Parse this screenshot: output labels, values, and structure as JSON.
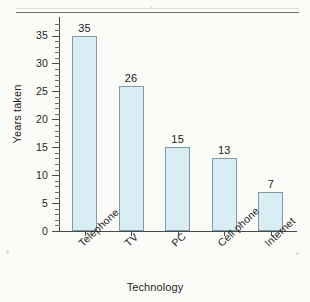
{
  "chart_data": {
    "type": "bar",
    "title": "",
    "subtitle": "",
    "xlabel": "Technology",
    "ylabel": "Years taken",
    "categories": [
      "Telephone",
      "TV",
      "PC",
      "Cell phone",
      "Internet"
    ],
    "values": [
      35,
      26,
      15,
      13,
      7
    ],
    "value_labels": [
      "35",
      "26",
      "15",
      "13",
      "7"
    ],
    "ylim": [
      0,
      35
    ],
    "y_major_ticks": [
      0,
      5,
      10,
      15,
      20,
      25,
      30,
      35
    ],
    "y_tick_labels": [
      "0",
      "5",
      "10",
      "15",
      "20",
      "25",
      "30",
      "35"
    ],
    "y_minor_tick_step": 1,
    "grid": false,
    "legend": false,
    "legend_position": "none",
    "x_tick_label_rotation": -43,
    "series": [
      {
        "name": "Years taken",
        "values": [
          35,
          26,
          15,
          13,
          7
        ]
      }
    ],
    "colors": {
      "bar_fill": "#d8edf4",
      "bar_edge": "#7d9aa6",
      "axis": "#4a4a4a",
      "text": "#1f1f1f",
      "background": "#fbfbf8",
      "top_rule": "#6e6e6e"
    }
  },
  "figure": {
    "top_rule_visible": true
  }
}
